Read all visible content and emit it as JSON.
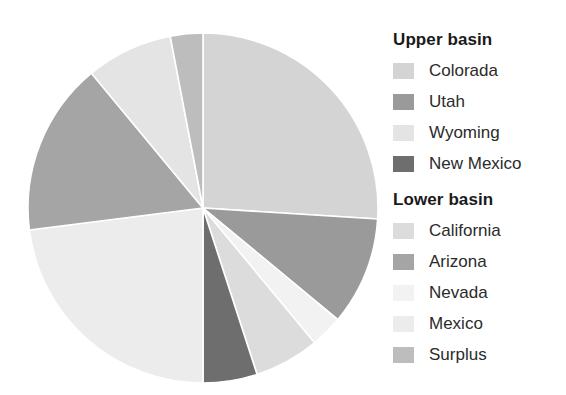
{
  "chart_data": {
    "type": "pie",
    "title": "",
    "legend_position": "right",
    "grid": false,
    "categories": [
      "Colorada",
      "Utah",
      "Nevada",
      "California",
      "New Mexico",
      "Mexico",
      "Arizona",
      "Wyoming",
      "Surplus"
    ],
    "values": [
      26.0,
      10.0,
      3.0,
      6.0,
      5.0,
      23.0,
      16.0,
      8.0,
      3.0
    ],
    "colors": [
      "#d4d4d4",
      "#9a9a9a",
      "#f2f2f2",
      "#dcdcdc",
      "#6e6e6e",
      "#ececec",
      "#a5a5a5",
      "#e4e4e4",
      "#bdbdbd"
    ],
    "start_angle_deg": 0,
    "direction": "clockwise",
    "slices": [
      {
        "label": "Colorada",
        "value": 26.0,
        "color": "#d4d4d4",
        "start_deg": 0,
        "end_deg": 93.6
      },
      {
        "label": "Utah",
        "value": 10.0,
        "color": "#9a9a9a",
        "start_deg": 93.6,
        "end_deg": 129.6
      },
      {
        "label": "Nevada",
        "value": 3.0,
        "color": "#f2f2f2",
        "start_deg": 129.6,
        "end_deg": 140.4
      },
      {
        "label": "California",
        "value": 6.0,
        "color": "#dcdcdc",
        "start_deg": 140.4,
        "end_deg": 162.0
      },
      {
        "label": "New Mexico",
        "value": 5.0,
        "color": "#6e6e6e",
        "start_deg": 162.0,
        "end_deg": 180.0
      },
      {
        "label": "Mexico",
        "value": 23.0,
        "color": "#ececec",
        "start_deg": 180.0,
        "end_deg": 262.8
      },
      {
        "label": "Arizona",
        "value": 16.0,
        "color": "#a5a5a5",
        "start_deg": 262.8,
        "end_deg": 320.4
      },
      {
        "label": "Wyoming",
        "value": 8.0,
        "color": "#e4e4e4",
        "start_deg": 320.4,
        "end_deg": 349.2
      },
      {
        "label": "Surplus",
        "value": 3.0,
        "color": "#bdbdbd",
        "start_deg": 349.2,
        "end_deg": 360.0
      }
    ]
  },
  "legend": {
    "groups": [
      {
        "title": "Upper basin",
        "items": [
          {
            "label": "Colorada",
            "color": "#d4d4d4"
          },
          {
            "label": "Utah",
            "color": "#9a9a9a"
          },
          {
            "label": "Wyoming",
            "color": "#e4e4e4"
          },
          {
            "label": "New Mexico",
            "color": "#6e6e6e"
          }
        ]
      },
      {
        "title": "Lower basin",
        "items": [
          {
            "label": "California",
            "color": "#dcdcdc"
          },
          {
            "label": "Arizona",
            "color": "#a5a5a5"
          },
          {
            "label": "Nevada",
            "color": "#f2f2f2"
          },
          {
            "label": "Mexico",
            "color": "#ececec"
          },
          {
            "label": "Surplus",
            "color": "#bdbdbd"
          }
        ]
      }
    ]
  },
  "pie_geometry": {
    "cx": 203,
    "cy": 208,
    "r": 175
  }
}
